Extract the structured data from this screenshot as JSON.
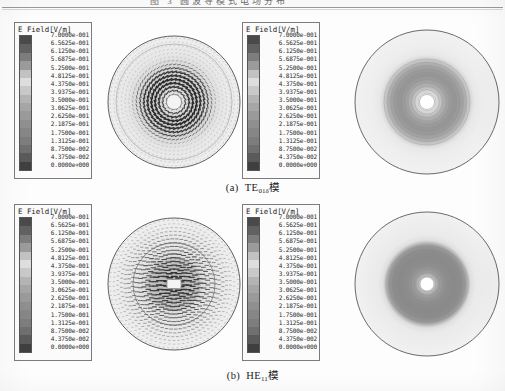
{
  "figure": {
    "top_fragment_text": "图 3  圆波导模式电场分布",
    "captions": [
      {
        "index_label": "(a)",
        "mode_main": "TE",
        "mode_sub": "01δ",
        "suffix": "模",
        "full": "(a) TE01δ模"
      },
      {
        "index_label": "(b)",
        "mode_main": "HE",
        "mode_sub": "11",
        "suffix": "模",
        "full": "(b) HE11模"
      }
    ]
  },
  "legend": {
    "title": "E Field[V/m]",
    "unit": "V/m",
    "quantity": "E Field",
    "ticks": [
      "7.0000e-001",
      "6.5625e-001",
      "6.1250e-001",
      "5.6875e-001",
      "5.2500e-001",
      "4.8125e-001",
      "4.3750e-001",
      "3.9375e-001",
      "3.5000e-001",
      "3.0625e-001",
      "2.6250e-001",
      "2.1875e-001",
      "1.7500e-001",
      "1.3125e-001",
      "8.7500e-002",
      "4.3750e-002",
      "0.0000e+000"
    ],
    "colorbar_colors": [
      "#4a4a4a",
      "#616161",
      "#7d7d7d",
      "#9b9b9b",
      "#c2c2c2",
      "#dedede",
      "#c9c9c9",
      "#b4b4b4",
      "#a6a6a6",
      "#9a9a9a",
      "#8f8f8f",
      "#868686",
      "#7d7d7d",
      "#6f6f6f",
      "#5a5a5a",
      "#3f3f3f"
    ],
    "max_value": "7.0000e-001",
    "min_value": "0.0000e+000"
  },
  "panels": [
    {
      "row": "a",
      "mode": "TE01δ",
      "legend_name": "legend-te01",
      "vector_plot": {
        "name": "te01-vector-plot",
        "type": "vector-field",
        "description": "azimuthal circulating arrows in circular waveguide cross-section",
        "hole_radius_frac": 0.095,
        "outer_radius_frac": 0.98
      },
      "contour_plot": {
        "name": "te01-contour-plot",
        "type": "contour-magnitude",
        "description": "annular ring of high field with null at center",
        "hole_radius_frac": 0.105
      }
    },
    {
      "row": "b",
      "mode": "HE11",
      "legend_name": "legend-he11",
      "vector_plot": {
        "name": "he11-vector-plot",
        "type": "vector-field",
        "description": "horizontally polarized arrows concentrated in core",
        "hole_radius_frac": 0.08,
        "outer_radius_frac": 0.98
      },
      "contour_plot": {
        "name": "he11-contour-plot",
        "type": "contour-magnitude",
        "description": "broad disc of high field with small null at center",
        "hole_radius_frac": 0.095
      }
    }
  ],
  "chart_data": {
    "type": "heatmap",
    "title": "E Field[V/m]",
    "subtitle": "",
    "xlabel": "",
    "ylabel": "",
    "legend_position": "left",
    "grid": false,
    "colormap": "grayscale-banded",
    "zlim": [
      0.0,
      0.7
    ],
    "levels": [
      0.0,
      0.04375,
      0.0875,
      0.13125,
      0.175,
      0.21875,
      0.2625,
      0.30625,
      0.35,
      0.39375,
      0.4375,
      0.48125,
      0.525,
      0.56875,
      0.6125,
      0.65625,
      0.7
    ],
    "level_labels": [
      "0.0000e+000",
      "4.3750e-002",
      "8.7500e-002",
      "1.3125e-001",
      "1.7500e-001",
      "2.1875e-001",
      "2.6250e-001",
      "3.0625e-001",
      "3.5000e-001",
      "3.9375e-001",
      "4.3750e-001",
      "4.8125e-001",
      "5.2500e-001",
      "5.6875e-001",
      "6.1250e-001",
      "6.5625e-001",
      "7.0000e-001"
    ],
    "series": [
      {
        "name": "(a) TE01δ模 — vector",
        "panel": "top-left-plot",
        "radial_profile_r": [
          0.0,
          0.1,
          0.2,
          0.3,
          0.4,
          0.5,
          0.6,
          0.7,
          0.8,
          0.9,
          1.0
        ],
        "radial_profile_E": [
          0.0,
          0.12,
          0.38,
          0.58,
          0.66,
          0.62,
          0.48,
          0.32,
          0.18,
          0.08,
          0.02
        ]
      },
      {
        "name": "(a) TE01δ模 — magnitude",
        "panel": "top-right-plot",
        "radial_profile_r": [
          0.0,
          0.1,
          0.2,
          0.3,
          0.4,
          0.5,
          0.6,
          0.7,
          0.8,
          0.9,
          1.0
        ],
        "radial_profile_E": [
          0.0,
          0.2,
          0.52,
          0.63,
          0.55,
          0.38,
          0.2,
          0.1,
          0.05,
          0.03,
          0.01
        ]
      },
      {
        "name": "(b) HE11模 — vector",
        "panel": "bottom-left-plot",
        "radial_profile_r": [
          0.0,
          0.1,
          0.2,
          0.3,
          0.4,
          0.5,
          0.6,
          0.7,
          0.8,
          0.9,
          1.0
        ],
        "radial_profile_E": [
          0.7,
          0.62,
          0.5,
          0.42,
          0.35,
          0.28,
          0.18,
          0.11,
          0.06,
          0.03,
          0.01
        ]
      },
      {
        "name": "(b) HE11模 — magnitude",
        "panel": "bottom-right-plot",
        "radial_profile_r": [
          0.0,
          0.1,
          0.2,
          0.3,
          0.4,
          0.5,
          0.6,
          0.7,
          0.8,
          0.9,
          1.0
        ],
        "radial_profile_E": [
          0.68,
          0.6,
          0.52,
          0.45,
          0.38,
          0.26,
          0.14,
          0.07,
          0.04,
          0.02,
          0.01
        ]
      }
    ]
  }
}
